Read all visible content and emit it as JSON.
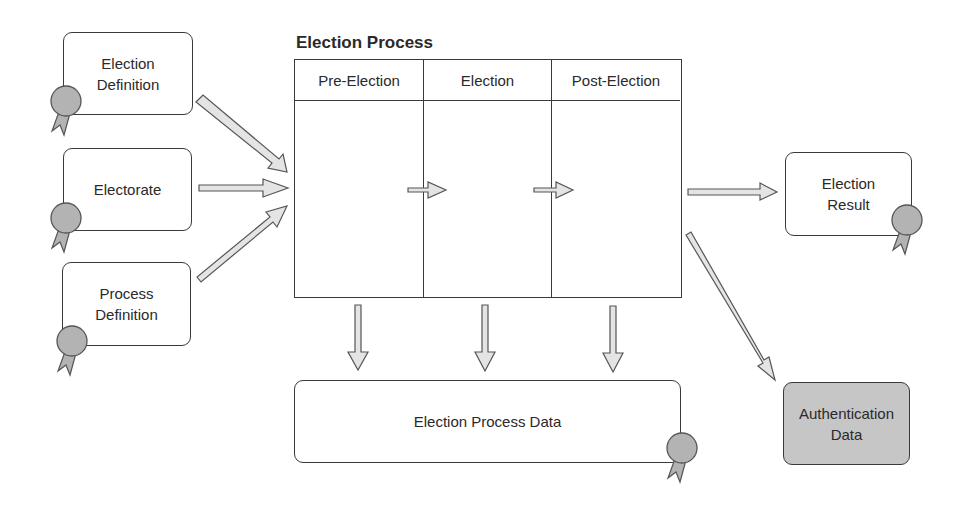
{
  "diagram": {
    "title": "Election Process",
    "inputs": [
      {
        "id": "election-definition",
        "label": "Election\nDefinition",
        "certified": true
      },
      {
        "id": "electorate",
        "label": "Electorate",
        "certified": true
      },
      {
        "id": "process-definition",
        "label": "Process\nDefinition",
        "certified": true
      }
    ],
    "process_phases": [
      {
        "label": "Pre-Election"
      },
      {
        "label": "Election"
      },
      {
        "label": "Post-Election"
      }
    ],
    "outputs": [
      {
        "id": "election-result",
        "label": "Election\nResult",
        "certified": true
      },
      {
        "id": "authentication-data",
        "label": "Authentication\nData",
        "certified": false,
        "fill": "#c6c6c6"
      }
    ],
    "process_data": {
      "label": "Election Process Data",
      "certified": true
    },
    "colors": {
      "stroke": "#3a3a3a",
      "arrow_fill": "#e4e4e4",
      "seal_fill": "#b3b3b3",
      "highlight_box": "#c6c6c6"
    }
  }
}
